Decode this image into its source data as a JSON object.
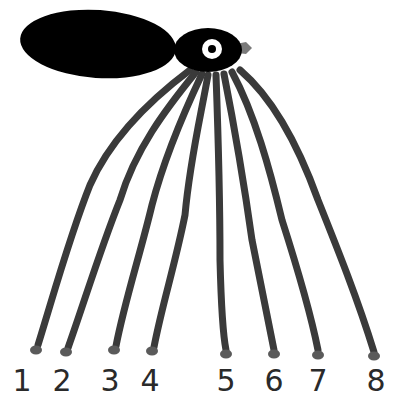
{
  "illustration": {
    "subject": "hand-drawn creature with eight legs",
    "colors": {
      "body": "#000000",
      "legs": "#3a3a3a",
      "beak": "#7a7a7a",
      "eye": "#ffffff"
    },
    "legs": [
      {
        "label": "1",
        "foot_x": 36,
        "foot_y": 350
      },
      {
        "label": "2",
        "foot_x": 66,
        "foot_y": 352
      },
      {
        "label": "3",
        "foot_x": 114,
        "foot_y": 350
      },
      {
        "label": "4",
        "foot_x": 152,
        "foot_y": 351
      },
      {
        "label": "5",
        "foot_x": 226,
        "foot_y": 354
      },
      {
        "label": "6",
        "foot_x": 274,
        "foot_y": 354
      },
      {
        "label": "7",
        "foot_x": 318,
        "foot_y": 355
      },
      {
        "label": "8",
        "foot_x": 374,
        "foot_y": 356
      }
    ],
    "labels": [
      "1",
      "2",
      "3",
      "4",
      "5",
      "6",
      "7",
      "8"
    ]
  }
}
